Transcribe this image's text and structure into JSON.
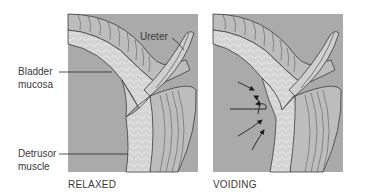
{
  "figure": {
    "panels": [
      {
        "id": "relaxed",
        "caption": "RELAXED"
      },
      {
        "id": "voiding",
        "caption": "VOIDING"
      }
    ],
    "labels": {
      "ureter": "Ureter",
      "bladder_mucosa_line1": "Bladder",
      "bladder_mucosa_line2": "mucosa",
      "detrusor_line1": "Detrusor",
      "detrusor_line2": "muscle"
    },
    "colors": {
      "lumen": "#a9a9a9",
      "mucosa": "#d2d2d2",
      "muscle": "#bdbdbd",
      "outline": "#3c3c3c",
      "text": "#3a3a3a"
    },
    "arrows": {
      "panel": "voiding",
      "count": 4,
      "direction": "toward ureteral orifice"
    }
  }
}
